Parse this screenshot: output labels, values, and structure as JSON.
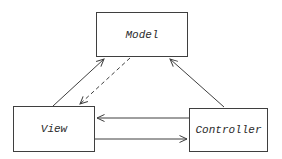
{
  "diagram": {
    "nodes": [
      {
        "id": "model",
        "label": "Model"
      },
      {
        "id": "view",
        "label": "View"
      },
      {
        "id": "controller",
        "label": "Controller"
      }
    ],
    "edges": [
      {
        "from": "view",
        "to": "model",
        "style": "solid"
      },
      {
        "from": "model",
        "to": "view",
        "style": "dashed"
      },
      {
        "from": "controller",
        "to": "model",
        "style": "solid"
      },
      {
        "from": "controller",
        "to": "view",
        "style": "solid"
      },
      {
        "from": "view",
        "to": "controller",
        "style": "solid"
      }
    ],
    "colors": {
      "line": "#3f3f3f",
      "background": "#ffffff",
      "text": "#2b2b2b"
    }
  }
}
